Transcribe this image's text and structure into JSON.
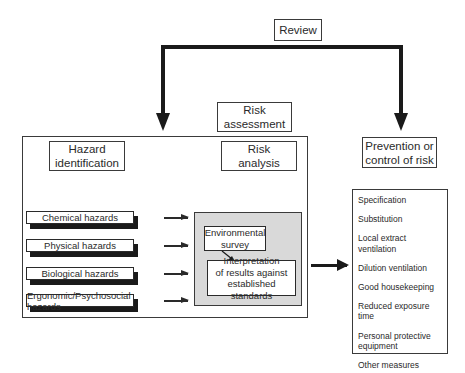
{
  "review": {
    "label": "Review"
  },
  "risk_assessment": {
    "label": "Risk\nassessment"
  },
  "hazard_identification": {
    "label": "Hazard\nidentification"
  },
  "risk_analysis": {
    "label": "Risk\nanalysis"
  },
  "prevention": {
    "label": "Prevention or\ncontrol of risk"
  },
  "hazards": [
    {
      "label": "Chemical hazards"
    },
    {
      "label": "Physical hazards"
    },
    {
      "label": "Biological hazards"
    },
    {
      "label": "Ergonomic/Psychosocial hazards"
    }
  ],
  "analysis": {
    "survey": "Environmental\nsurvey",
    "interpretation": "Interpretation\nof results against\nestablished standards"
  },
  "controls": [
    {
      "label": "Specification"
    },
    {
      "label": "Substitution"
    },
    {
      "label": "Local extract\nventilation"
    },
    {
      "label": "Dilution ventilation"
    },
    {
      "label": "Good housekeeping"
    },
    {
      "label": "Reduced exposure time"
    },
    {
      "label": "Personal protective\nequipment"
    },
    {
      "label": "Other measures"
    }
  ],
  "colors": {
    "line": "#1a1a1a",
    "panel": "#d9d9d9",
    "background": "#ffffff"
  }
}
